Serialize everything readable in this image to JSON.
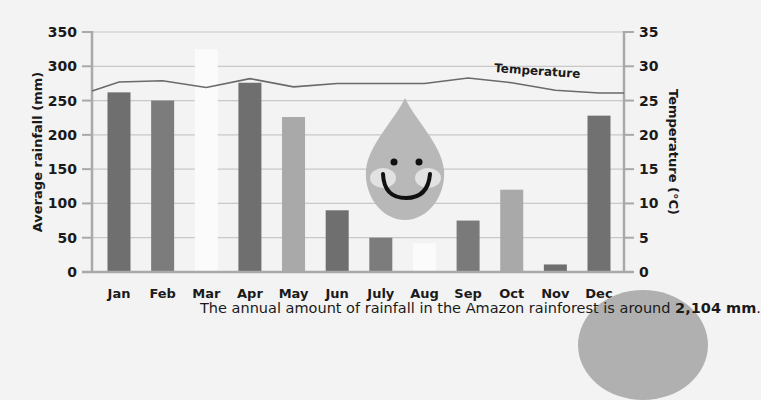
{
  "chart_data": {
    "type": "bar",
    "title": "",
    "categories": [
      "Jan",
      "Feb",
      "Mar",
      "Apr",
      "May",
      "Jun",
      "July",
      "Aug",
      "Sep",
      "Oct",
      "Nov",
      "Dec"
    ],
    "series": [
      {
        "name": "Average rainfall (mm)",
        "type": "bar",
        "axis": "left",
        "values": [
          262,
          250,
          325,
          276,
          226,
          90,
          50,
          42,
          75,
          120,
          11,
          228
        ],
        "colors": [
          "#6f6f6f",
          "#7c7c7c",
          "#fbfbfb",
          "#6f6f6f",
          "#a9a9a9",
          "#6f6f6f",
          "#7c7c7c",
          "#fbfbfb",
          "#7a7a7a",
          "#a9a9a9",
          "#6f6f6f",
          "#717171"
        ]
      },
      {
        "name": "Temperature",
        "type": "line",
        "axis": "right",
        "values": [
          27.7,
          27.9,
          26.9,
          28.2,
          27.0,
          27.5,
          27.5,
          27.5,
          28.3,
          27.6,
          26.5,
          26.1
        ],
        "start_value": 26.4,
        "color": "#6a6a6a"
      }
    ],
    "xlabel": "",
    "ylabel": "Average rainfall (mm)",
    "ylabel_right": "Temperature (°C)",
    "ylim": [
      0,
      350
    ],
    "ylim_right": [
      0,
      35
    ],
    "yticks": [
      0,
      50,
      100,
      150,
      200,
      250,
      300,
      350
    ],
    "yticks_right": [
      0,
      5,
      10,
      15,
      20,
      25,
      30,
      35
    ],
    "grid": true,
    "legend": "inline label on temperature line",
    "annotations": [
      "Temperature"
    ]
  },
  "caption": {
    "prefix": "The annual amount of rainfall in the Amazon rainforest is around ",
    "highlight": "2,104 mm",
    "suffix": "."
  },
  "colors": {
    "background": "#f3f3f3",
    "grid": "#c8c8c8",
    "axis": "#a9a9a9",
    "drop": "#b8b8b8",
    "drop_cheek": "#e2e2e2",
    "face": "#111111"
  }
}
